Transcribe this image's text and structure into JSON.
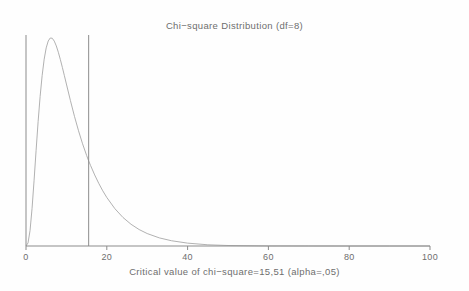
{
  "chart_data": {
    "type": "line",
    "title": "Chi−square Distribution (df=8)",
    "xlabel": "Critical value of chi−square=15,51 (alpha=,05)",
    "ylabel": "",
    "df": 8,
    "critical_value": 15.51,
    "alpha": 0.05,
    "xlim": [
      0,
      100
    ],
    "ylim": [
      0,
      0.12
    ],
    "grid": false,
    "legend": "none",
    "xticks": [
      0,
      20,
      40,
      60,
      80,
      100
    ],
    "xtick_labels": [
      "0",
      "20",
      "40",
      "60",
      "80",
      "100"
    ],
    "yticks": [],
    "ytick_labels": [],
    "series": [
      {
        "name": "chi-square pdf (df=8)",
        "color": "#a8a8a8",
        "x": [
          0,
          0.5,
          1,
          1.5,
          2,
          2.5,
          3,
          3.5,
          4,
          4.5,
          5,
          5.5,
          6,
          6.5,
          7,
          7.5,
          8,
          8.5,
          9,
          9.5,
          10,
          11,
          12,
          13,
          14,
          15,
          15.51,
          16,
          17,
          18,
          19,
          20,
          22,
          24,
          26,
          28,
          30,
          33,
          36,
          40,
          45,
          50,
          60,
          70,
          80,
          90,
          100
        ],
        "y": [
          0,
          0.00152,
          0.00766,
          0.01869,
          0.0327,
          0.04761,
          0.06187,
          0.07448,
          0.08491,
          0.09294,
          0.09858,
          0.102,
          0.10349,
          0.10336,
          0.10194,
          0.09954,
          0.09641,
          0.09279,
          0.08885,
          0.08475,
          0.08059,
          0.07231,
          0.0645,
          0.05733,
          0.05086,
          0.0451,
          0.04232,
          0.03999,
          0.03535,
          0.03119,
          0.02746,
          0.02414,
          0.01857,
          0.0142,
          0.01081,
          0.00819,
          0.00619,
          0.00404,
          0.00262,
          0.00143,
          0.0006,
          0.00025,
          4e-05,
          1e-05,
          0.0,
          0.0,
          0.0
        ]
      }
    ],
    "vertical_lines": [
      {
        "name": "y-axis-line",
        "x": 0,
        "color": "#8c8c8c"
      },
      {
        "name": "critical-value-line",
        "x": 15.51,
        "color": "#8c8c8c"
      }
    ],
    "axis_color": "#8c8c8c"
  }
}
